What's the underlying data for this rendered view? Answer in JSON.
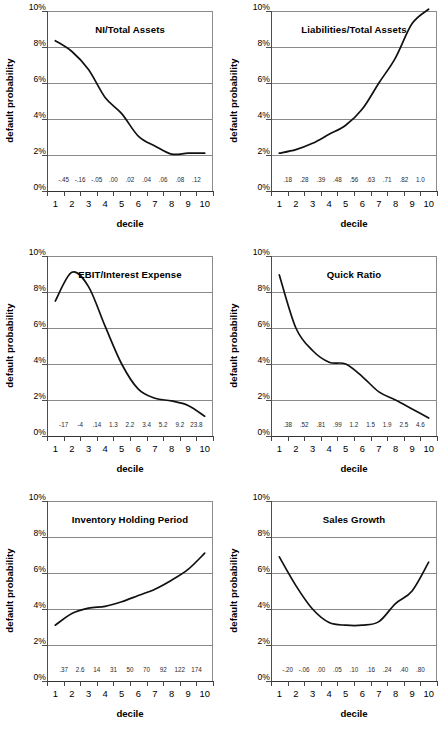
{
  "figure": {
    "panel_count": 6,
    "y_axis_label": "default probability",
    "x_axis_label": "decile",
    "y_ticks": [
      "10%",
      "8%",
      "6%",
      "4%",
      "2%",
      "0%"
    ],
    "x_ticks": [
      "1",
      "2",
      "3",
      "4",
      "5",
      "6",
      "7",
      "8",
      "9",
      "10"
    ],
    "grid_color": "#8a8a8a",
    "curve_color": "#111111",
    "background": "#ffffff"
  },
  "chart_data": [
    {
      "type": "line",
      "title": "NI/Total Assets",
      "xlabel": "decile",
      "ylabel": "default probability",
      "ylim": [
        0,
        10
      ],
      "yunit": "%",
      "grid": true,
      "legend": "none",
      "categories": [
        "1",
        "2",
        "3",
        "4",
        "5",
        "6",
        "7",
        "8",
        "9",
        "10"
      ],
      "values": [
        8.35,
        7.75,
        6.75,
        5.2,
        4.3,
        3.05,
        2.5,
        2.05,
        2.1,
        2.1
      ],
      "bin_value_labels": [
        "-.45",
        "-.16",
        "-.05",
        ".00",
        ".02",
        ".04",
        ".06",
        ".08",
        ".12"
      ],
      "annotation": "monotonically declining default probability as net income to total assets increases"
    },
    {
      "type": "line",
      "title": "Liabilities/Total Assets",
      "xlabel": "decile",
      "ylabel": "default probability",
      "ylim": [
        0,
        10
      ],
      "yunit": "%",
      "grid": true,
      "legend": "none",
      "categories": [
        "1",
        "2",
        "3",
        "4",
        "5",
        "6",
        "7",
        "8",
        "9",
        "10"
      ],
      "values": [
        2.1,
        2.3,
        2.65,
        3.15,
        3.65,
        4.55,
        6.0,
        7.4,
        9.3,
        10.1
      ],
      "bin_value_labels": [
        ".18",
        ".28",
        ".39",
        ".48",
        ".56",
        ".63",
        ".71",
        ".82",
        "1.0"
      ],
      "annotation": "default probability rises steeply with leverage"
    },
    {
      "type": "line",
      "title": "EBIT/Interest Expense",
      "xlabel": "decile",
      "ylabel": "default probability",
      "ylim": [
        0,
        10
      ],
      "yunit": "%",
      "grid": true,
      "legend": "none",
      "categories": [
        "1",
        "2",
        "3",
        "4",
        "5",
        "6",
        "7",
        "8",
        "9",
        "10"
      ],
      "values": [
        7.5,
        9.1,
        8.3,
        6.1,
        4.0,
        2.6,
        2.1,
        1.95,
        1.7,
        1.1
      ],
      "bin_value_labels": [
        "-17",
        "-4",
        ".14",
        "1.3",
        "2.2",
        "3.4",
        "5.2",
        "9.2",
        "23.8"
      ],
      "annotation": "hump at decile 2 then steep decline"
    },
    {
      "type": "line",
      "title": "Quick Ratio",
      "xlabel": "decile",
      "ylabel": "default probability",
      "ylim": [
        0,
        10
      ],
      "yunit": "%",
      "grid": true,
      "legend": "none",
      "categories": [
        "1",
        "2",
        "3",
        "4",
        "5",
        "6",
        "7",
        "8",
        "9",
        "10"
      ],
      "values": [
        8.95,
        6.0,
        4.75,
        4.1,
        4.0,
        3.3,
        2.45,
        2.0,
        1.5,
        1.0
      ],
      "bin_value_labels": [
        ".38",
        ".52",
        ".81",
        ".99",
        "1.2",
        "1.5",
        "1.9",
        "2.5",
        "4.6"
      ],
      "annotation": "default probability falls as liquidity improves"
    },
    {
      "type": "line",
      "title": "Inventory Holding Period",
      "xlabel": "decile",
      "ylabel": "default probability",
      "ylim": [
        0,
        10
      ],
      "yunit": "%",
      "grid": true,
      "legend": "none",
      "categories": [
        "1",
        "2",
        "3",
        "4",
        "5",
        "6",
        "7",
        "8",
        "9",
        "10"
      ],
      "values": [
        3.1,
        3.75,
        4.05,
        4.15,
        4.4,
        4.75,
        5.1,
        5.6,
        6.2,
        7.1
      ],
      "bin_value_labels": [
        ".37",
        "2.6",
        "14",
        "31",
        "50",
        "70",
        "92",
        "122",
        "174"
      ],
      "annotation": "default probability increases with longer inventory holding period"
    },
    {
      "type": "line",
      "title": "Sales Growth",
      "xlabel": "decile",
      "ylabel": "default probability",
      "ylim": [
        0,
        10
      ],
      "yunit": "%",
      "grid": true,
      "legend": "none",
      "categories": [
        "1",
        "2",
        "3",
        "4",
        "5",
        "6",
        "7",
        "8",
        "9",
        "10"
      ],
      "values": [
        6.9,
        5.3,
        4.0,
        3.25,
        3.1,
        3.1,
        3.3,
        4.3,
        5.0,
        6.6
      ],
      "bin_value_labels": [
        "-.20",
        "-.06",
        ".00",
        ".05",
        ".10",
        ".16",
        ".24",
        ".40",
        ".80"
      ],
      "annotation": "U-shaped: highest default risk at extremes of sales growth"
    }
  ]
}
